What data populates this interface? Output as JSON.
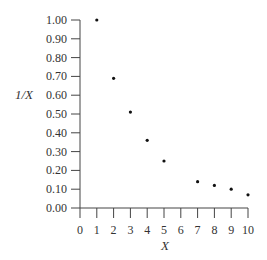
{
  "chart_data": {
    "type": "scatter",
    "title": "",
    "xlabel": "X",
    "ylabel": "1/X",
    "xlim": [
      0,
      10
    ],
    "ylim": [
      0,
      1.0
    ],
    "x_ticks": [
      "0",
      "1",
      "2",
      "3",
      "4",
      "5",
      "6",
      "7",
      "8",
      "9",
      "10"
    ],
    "y_ticks": [
      "0.00",
      "0.10",
      "0.20",
      "0.30",
      "0.40",
      "0.50",
      "0.60",
      "0.70",
      "0.80",
      "0.90",
      "1.00"
    ],
    "grid": false,
    "legend": null,
    "series": [
      {
        "name": "1/X",
        "x": [
          1,
          2,
          3,
          4,
          5,
          7,
          8,
          9,
          10
        ],
        "y": [
          1.0,
          0.69,
          0.51,
          0.36,
          0.25,
          0.14,
          0.12,
          0.1,
          0.07
        ]
      }
    ]
  }
}
